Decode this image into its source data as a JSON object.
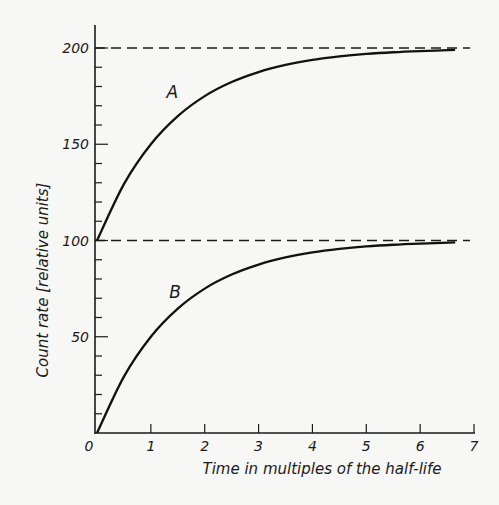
{
  "chart_data": {
    "type": "line",
    "title": "",
    "xlabel": "Time in multiples of the half-life",
    "ylabel": "Count rate [relative units]",
    "xlim": [
      0,
      7
    ],
    "ylim": [
      0,
      210
    ],
    "x_ticks": [
      0,
      1,
      2,
      3,
      4,
      5,
      6,
      7
    ],
    "x_tick_labels": [
      "0",
      "1",
      "2",
      "3",
      "4",
      "5",
      "6",
      "7"
    ],
    "y_major_ticks": [
      50,
      100,
      150,
      200
    ],
    "y_tick_labels": [
      "50",
      "100",
      "150",
      "200"
    ],
    "y_minor_tick_step": 10,
    "grid": false,
    "legend": "none (curves labelled inline)",
    "reference_lines": [
      {
        "type": "horizontal-dashed",
        "y": 200
      },
      {
        "type": "horizontal-dashed",
        "y": 100
      }
    ],
    "series": [
      {
        "name": "A",
        "label_position": {
          "x": 1.4,
          "y": 174
        },
        "x": [
          0,
          0.5,
          1,
          1.5,
          2,
          2.5,
          3,
          3.5,
          4,
          4.5,
          5,
          5.5,
          6,
          6.65
        ],
        "values": [
          100,
          129.3,
          150,
          164.6,
          175,
          182.3,
          187.5,
          191.2,
          193.8,
          195.6,
          196.9,
          197.8,
          198.4,
          199.0
        ]
      },
      {
        "name": "B",
        "label_position": {
          "x": 1.45,
          "y": 70
        },
        "x": [
          0,
          0.5,
          1,
          1.5,
          2,
          2.5,
          3,
          3.5,
          4,
          4.5,
          5,
          5.5,
          6,
          6.65
        ],
        "values": [
          0,
          29.3,
          50,
          64.6,
          75,
          82.3,
          87.5,
          91.2,
          93.8,
          95.6,
          96.9,
          97.8,
          98.4,
          99.0
        ]
      }
    ]
  }
}
